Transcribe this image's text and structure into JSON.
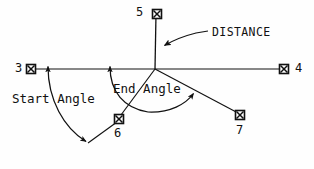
{
  "diagram": {
    "kind": "cad-angle-distance-dimension-diagram",
    "width": 314,
    "height": 169,
    "background_color": "#fefefe",
    "stroke_color": "#111111",
    "nodes": [
      {
        "id": "node-3",
        "label": "3",
        "x": 31,
        "y": 69,
        "label_x": 15,
        "label_y": 62,
        "marker": "square-x-node-marker"
      },
      {
        "id": "node-4",
        "label": "4",
        "x": 284,
        "y": 69,
        "label_x": 295,
        "label_y": 62,
        "marker": "square-x-node-marker"
      },
      {
        "id": "node-5",
        "label": "5",
        "x": 157,
        "y": 14,
        "label_x": 136,
        "label_y": 7,
        "marker": "square-x-node-marker"
      },
      {
        "id": "node-6",
        "label": "6",
        "x": 119,
        "y": 119,
        "label_x": 114,
        "label_y": 130,
        "marker": "square-x-node-marker"
      },
      {
        "id": "node-7",
        "label": "7",
        "x": 240,
        "y": 115,
        "label_x": 236,
        "label_y": 127,
        "marker": "square-x-node-marker"
      }
    ],
    "center_hub": {
      "x": 155,
      "y": 69
    },
    "annotations": [
      {
        "id": "start-angle",
        "label": "Start Angle",
        "label_x": 12,
        "label_y": 94,
        "measures": "angle from baseline to ray toward node 6"
      },
      {
        "id": "end-angle",
        "label": "End Angle",
        "label_x": 113,
        "label_y": 84,
        "measures": "angle from baseline to ray toward node 7"
      },
      {
        "id": "distance",
        "label": "DISTANCE",
        "label_x": 212,
        "label_y": 27,
        "measures": "length along vertical line to node 5"
      }
    ]
  }
}
